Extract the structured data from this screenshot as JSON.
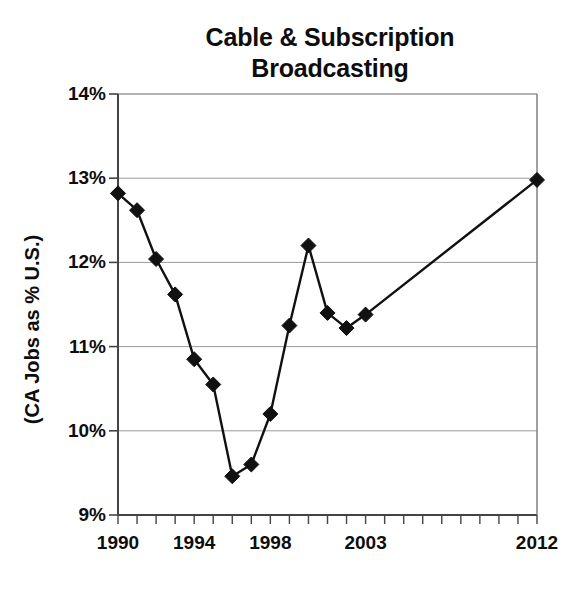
{
  "chart_data": {
    "type": "line",
    "title": "Cable & Subscription Broadcasting",
    "title_lines": [
      "Cable & Subscription",
      "Broadcasting"
    ],
    "xlabel": "",
    "ylabel": "(CA Jobs as % U.S.)",
    "ylim": [
      9,
      14
    ],
    "ytick_labels": [
      "14%",
      "13%",
      "12%",
      "11%",
      "10%",
      "9%"
    ],
    "ytick_values": [
      14,
      13,
      12,
      11,
      10,
      9
    ],
    "xlim": [
      1990,
      2012
    ],
    "xtick_labels": [
      "1990",
      "1994",
      "1998",
      "2003",
      "2012"
    ],
    "xtick_values": [
      1990,
      1994,
      1998,
      2003,
      2012
    ],
    "grid": "horizontal",
    "legend": "none",
    "marker": "diamond",
    "line_color": "#111111",
    "marker_color": "#111111",
    "grid_color": "#9a9a9a",
    "axis_color": "#555555",
    "x": [
      1990,
      1991,
      1992,
      1993,
      1994,
      1995,
      1996,
      1997,
      1998,
      1999,
      2000,
      2001,
      2002,
      2003,
      2012
    ],
    "values": [
      12.82,
      12.62,
      12.04,
      11.62,
      10.85,
      10.55,
      9.46,
      9.6,
      10.2,
      11.25,
      12.2,
      11.4,
      11.22,
      11.38,
      12.98
    ],
    "series": [
      {
        "name": "CA Jobs as % U.S.",
        "values": [
          12.82,
          12.62,
          12.04,
          11.62,
          10.85,
          10.55,
          9.46,
          9.6,
          10.2,
          11.25,
          12.2,
          11.4,
          11.22,
          11.38,
          12.98
        ]
      }
    ]
  }
}
